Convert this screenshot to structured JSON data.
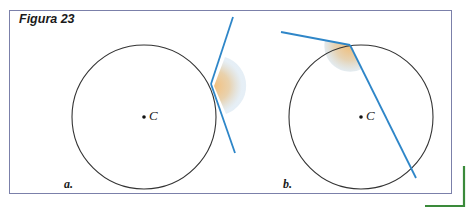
{
  "figure": {
    "title": "Figura 23",
    "panels": [
      {
        "label": "a.",
        "center_label": "C",
        "description": "Circle with a tangent line touching at one point; shaded angle region at the tangent point"
      },
      {
        "label": "b.",
        "center_label": "C",
        "description": "Circle with a tangent line and a secant line meeting at a point on the circle; shaded angle region between them"
      }
    ],
    "colors": {
      "frame_border": "#7b80aa",
      "circle_stroke": "#333333",
      "line_stroke": "#2e86c8",
      "shade_inner": "#f2c58a",
      "shade_outer": "#cfe0ee",
      "corner_mark": "#3a8a3a"
    }
  }
}
